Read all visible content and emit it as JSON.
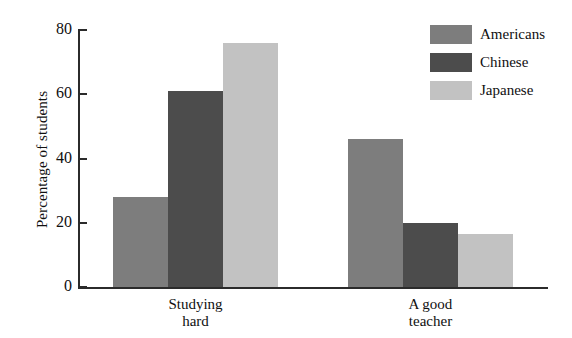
{
  "chart_data": {
    "type": "bar",
    "title": "",
    "xlabel": "",
    "ylabel": "Percentage of students",
    "ylim": [
      0,
      80
    ],
    "yticks": [
      0,
      20,
      40,
      60,
      80
    ],
    "ytick_labels": [
      "0",
      "20",
      "40",
      "60",
      "80"
    ],
    "grid": false,
    "legend_position": "top-right",
    "categories": [
      "Studying hard",
      "A good teacher"
    ],
    "category_lines": [
      [
        "Studying",
        "hard"
      ],
      [
        "A good",
        "teacher"
      ]
    ],
    "series": [
      {
        "name": "Americans",
        "color": "#7d7d7d",
        "values": [
          28,
          46
        ]
      },
      {
        "name": "Chinese",
        "color": "#4c4c4c",
        "values": [
          61,
          20
        ]
      },
      {
        "name": "Japanese",
        "color": "#c2c2c2",
        "values": [
          76,
          16.5
        ]
      }
    ]
  },
  "legend": {
    "items": [
      {
        "label": "Americans",
        "color": "#7d7d7d"
      },
      {
        "label": "Chinese",
        "color": "#4c4c4c"
      },
      {
        "label": "Japanese",
        "color": "#c2c2c2"
      }
    ]
  },
  "axis": {
    "y_title": "Percentage of students",
    "y_labels": [
      "80",
      "60",
      "40",
      "20",
      "0"
    ]
  },
  "colors": {
    "axis": "#2b2b2b",
    "text": "#101010",
    "background": "#ffffff"
  }
}
